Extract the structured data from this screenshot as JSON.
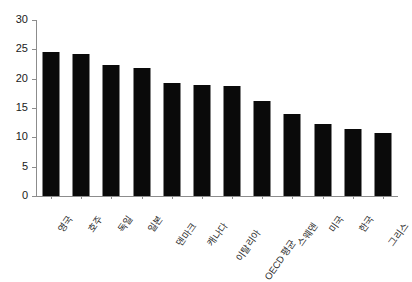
{
  "chart_data": {
    "type": "bar",
    "title": "",
    "xlabel": "",
    "ylabel": "",
    "ylim": [
      0,
      30
    ],
    "yticks": [
      0,
      5,
      10,
      15,
      20,
      25,
      30
    ],
    "ytick_labels": [
      "0",
      "5",
      "10",
      "15",
      "20",
      "25",
      "30"
    ],
    "grid": false,
    "legend": "none",
    "bar_color": "#0a0a0a",
    "axis_color": "#8c8c8c",
    "categories": [
      "영국",
      "호주",
      "독일",
      "일본",
      "덴마크",
      "캐나다",
      "이탈리아",
      "OECD 평균",
      "스웨덴",
      "미국",
      "한국",
      "그리스"
    ],
    "values": [
      24.5,
      24.2,
      22.3,
      21.8,
      19.3,
      19.0,
      18.7,
      16.2,
      14.0,
      12.3,
      11.4,
      10.7
    ]
  }
}
